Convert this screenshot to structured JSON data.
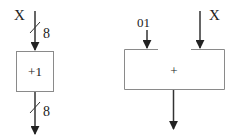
{
  "diagram": {
    "incrementer": {
      "input_label": "X",
      "input_width": "8",
      "operation": "+1",
      "output_width": "8"
    },
    "adder": {
      "input_a_label": "01",
      "input_b_label": "X",
      "operation": "+"
    },
    "colors": {
      "stroke": "#8a8a8a",
      "arrow": "#222222",
      "text": "#222222"
    }
  }
}
